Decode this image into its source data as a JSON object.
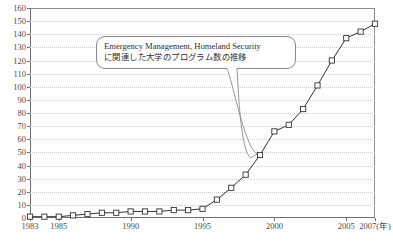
{
  "chart_data": {
    "type": "line",
    "title": "",
    "xlabel": "年",
    "ylabel": "",
    "ylim": [
      0,
      160
    ],
    "ytick_step": 10,
    "yticks": [
      0,
      10,
      20,
      30,
      40,
      50,
      60,
      70,
      80,
      90,
      100,
      110,
      120,
      130,
      140,
      150,
      160
    ],
    "xlim": [
      1983,
      2007
    ],
    "xticks": [
      1983,
      1985,
      1990,
      1995,
      2000,
      2005,
      2007
    ],
    "xtick_labels": [
      "1983",
      "1985",
      "1990",
      "1995",
      "2000",
      "2005",
      "2007(年)"
    ],
    "grid": "horizontal-dotted",
    "legend": "none",
    "marker": "open-square",
    "line_color": "#333333",
    "grid_color": "#cfcfcf",
    "x": [
      1983,
      1984,
      1985,
      1986,
      1987,
      1988,
      1989,
      1990,
      1991,
      1992,
      1993,
      1994,
      1995,
      1996,
      1997,
      1998,
      1999,
      2000,
      2001,
      2002,
      2003,
      2004,
      2005,
      2006,
      2007
    ],
    "values": [
      1,
      1,
      1,
      2,
      3,
      4,
      4,
      5,
      5,
      5,
      6,
      6,
      7,
      14,
      23,
      33,
      48,
      66,
      71,
      83,
      101,
      120,
      137,
      142,
      148
    ],
    "series": [
      {
        "name": "Emergency Management / Homeland Security 関連大学プログラム数",
        "values": [
          1,
          1,
          1,
          2,
          3,
          4,
          4,
          5,
          5,
          5,
          6,
          6,
          7,
          14,
          23,
          33,
          48,
          66,
          71,
          83,
          101,
          120,
          137,
          142,
          148
        ]
      }
    ],
    "annotations": [
      {
        "name": "callout",
        "line1": "Emergency Management, Homeland Security",
        "line2": "に関連した大学のプログラム数の推移",
        "points_to_year": 1999
      }
    ]
  },
  "axis": {
    "x_unit_label": "2007(年)"
  }
}
